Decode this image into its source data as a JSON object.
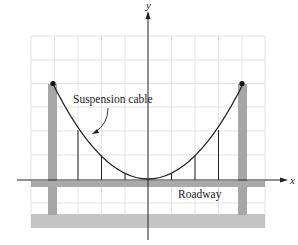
{
  "diagram": {
    "axes": {
      "x_label": "x",
      "y_label": "y"
    },
    "labels": {
      "cable": "Suspension cable",
      "roadway": "Roadway"
    },
    "colors": {
      "grid": "#e3e3e3",
      "pillar": "#a6a6a6",
      "roadway": "#a9a9a9",
      "base": "#c4c4c4",
      "line": "#222222"
    },
    "grid": {
      "columns": 10,
      "rows": 8
    },
    "hangers_count": 6,
    "towers": [
      "left-tower",
      "right-tower"
    ]
  }
}
